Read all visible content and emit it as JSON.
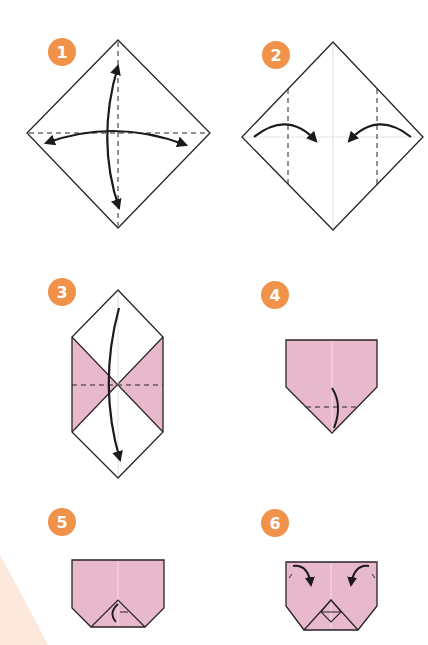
{
  "colors": {
    "badge": "#f0924a",
    "paper_pink": "#e8b8cc",
    "line": "#2a2226",
    "background_accent": "#fde8dc"
  },
  "steps": [
    {
      "number": "1",
      "description": "Diamond square with horizontal and vertical crease lines; fold and unfold both diagonals"
    },
    {
      "number": "2",
      "description": "Fold left and right corners toward the center along vertical dashed lines"
    },
    {
      "number": "3",
      "description": "Hexagonal shape with pink triangular flaps; fold top down along horizontal dashed line"
    },
    {
      "number": "4",
      "description": "Pink pentagon shape; fold bottom point up along dashed line"
    },
    {
      "number": "5",
      "description": "Pink shape with chamfered bottom corners and small triangle fold at bottom center"
    },
    {
      "number": "6",
      "description": "Pink shape with top corners folding down and small diamond at bottom center"
    }
  ]
}
